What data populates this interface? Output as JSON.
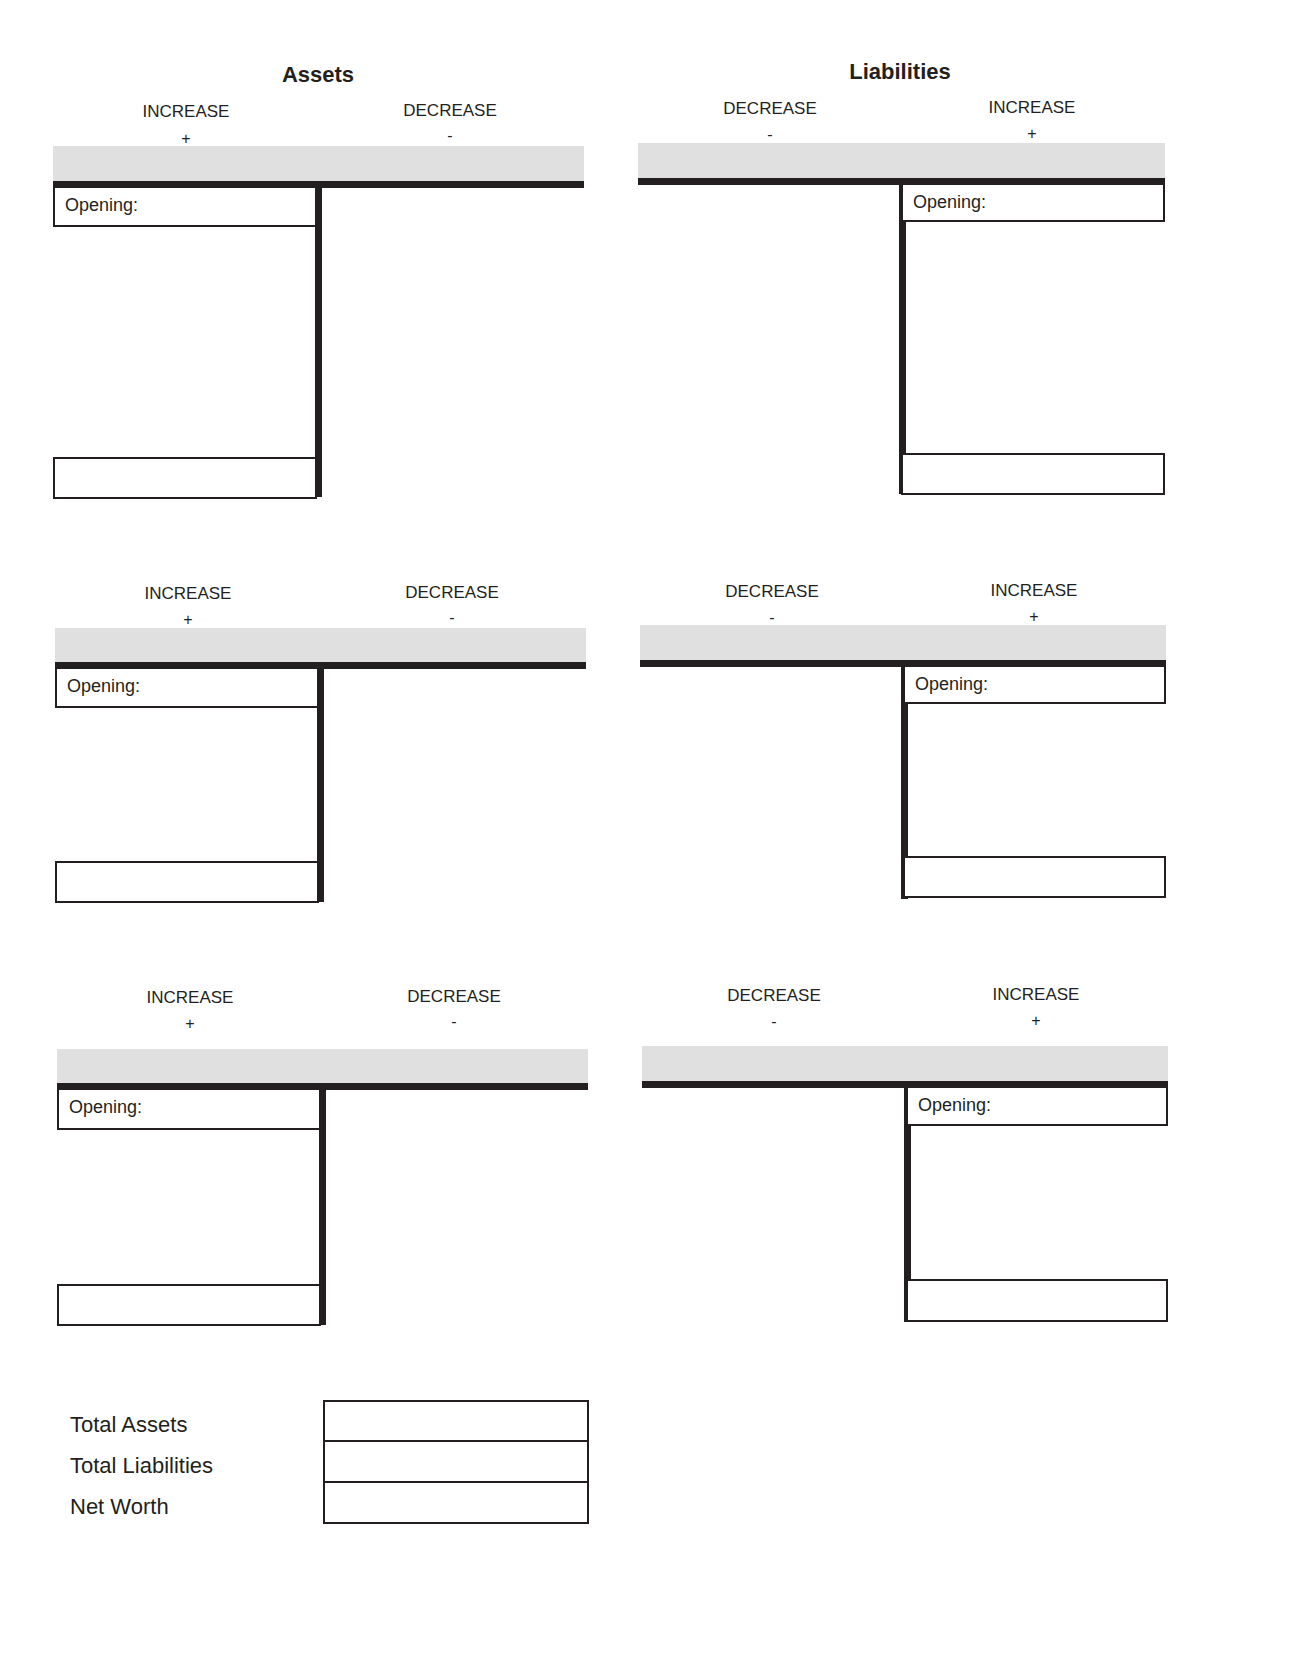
{
  "title": "PERSONAL BALANCE SHEET",
  "sections": {
    "assets": {
      "title": "Assets"
    },
    "liabilities": {
      "title": "Liabilities"
    }
  },
  "columns": {
    "increase": "INCREASE",
    "decrease": "DECREASE",
    "plus": "+",
    "minus": "-"
  },
  "accounts": {
    "opening_label": "Opening:"
  },
  "totals": {
    "rows": [
      {
        "label": "Total Assets",
        "value": ""
      },
      {
        "label": "Total Liabilities",
        "value": ""
      },
      {
        "label": "Net Worth",
        "value": ""
      }
    ]
  },
  "colors": {
    "ink": "#231f20",
    "band": "#e0e0e0"
  }
}
